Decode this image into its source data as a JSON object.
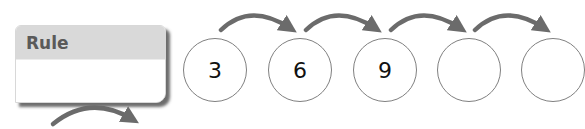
{
  "rule_box": {
    "title": "Rule",
    "value": ""
  },
  "sequence": [
    {
      "value": "3"
    },
    {
      "value": "6"
    },
    {
      "value": "9"
    },
    {
      "value": ""
    },
    {
      "value": ""
    }
  ],
  "colors": {
    "arrow": "#6b6b6b",
    "circle_border": "#808080",
    "rule_header": "#d9d9d9",
    "rule_title": "#5a5a5a"
  }
}
